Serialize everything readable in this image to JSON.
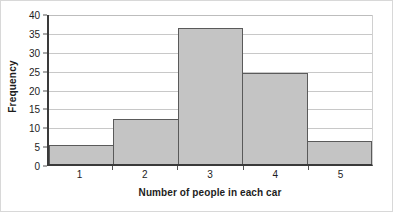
{
  "chart_data": {
    "type": "bar",
    "title": "",
    "subtitle": "",
    "xlabel": "Number of people in each car",
    "ylabel": "Frequency",
    "categories": [
      "1",
      "2",
      "3",
      "4",
      "5"
    ],
    "values": [
      5,
      12,
      36,
      24,
      6
    ],
    "series": [
      {
        "name": "Frequency",
        "values": [
          5,
          12,
          36,
          24,
          6
        ]
      }
    ],
    "ylim": [
      0,
      40
    ],
    "ytick_values": [
      0,
      5,
      10,
      15,
      20,
      25,
      30,
      35,
      40
    ],
    "ytick_labels": [
      "0",
      "5",
      "10",
      "15",
      "20",
      "25",
      "30",
      "35",
      "40"
    ],
    "xtick_labels": [
      "1",
      "2",
      "3",
      "4",
      "5"
    ],
    "grid": true,
    "grid_axis": "y",
    "legend": false,
    "legend_position": "none",
    "bar_gap": 0,
    "annotations": [],
    "colors": {
      "bar_fill": "#c4c4c4",
      "bar_border": "#5a5a5a",
      "axis": "#3a3a3a",
      "gridline": "#c8c8c8",
      "text": "#1d1d1d",
      "background": "#ffffff",
      "frame": "#d8d8d8"
    }
  }
}
